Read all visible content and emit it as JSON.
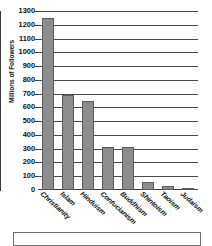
{
  "chart_data": {
    "type": "bar",
    "title": "",
    "xlabel": "",
    "ylabel": "Millions of Followers",
    "ylim": [
      0,
      1300
    ],
    "ytick_step": 100,
    "grid": true,
    "legend": "none",
    "orientation": "vertical",
    "bar_color": "#8d8d8d",
    "bar_edge_color": "#5a5a5a",
    "categories": [
      "Christianity",
      "Islam",
      "Hinduism",
      "Confucianism",
      "Buddhism",
      "Shintoism",
      "Taoism",
      "Judaism"
    ],
    "values": [
      1250,
      690,
      650,
      310,
      310,
      60,
      30,
      15
    ],
    "ytick_labels": [
      "1300",
      "1200",
      "1100",
      "1000",
      "900",
      "800",
      "700",
      "600",
      "500",
      "400",
      "300",
      "200",
      "100",
      "0"
    ]
  },
  "axis": {
    "y_title": "Millions of Followers"
  }
}
